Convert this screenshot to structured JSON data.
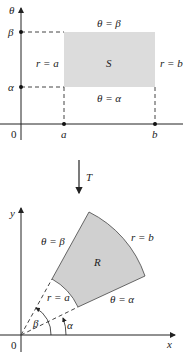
{
  "top_diagram": {
    "axis_vertical": "θ",
    "origin": "0",
    "tick_beta": "β",
    "tick_alpha": "α",
    "tick_a": "a",
    "tick_b": "b",
    "top_edge": "θ = β",
    "bottom_edge": "θ = α",
    "left_edge": "r = a",
    "right_edge": "r = b",
    "region": "S",
    "region_fill": "#dcdcdc"
  },
  "transform": {
    "label": "T"
  },
  "bottom_diagram": {
    "axis_x": "x",
    "axis_y": "y",
    "origin": "0",
    "beta_ray": "θ = β",
    "alpha_ray": "θ = α",
    "inner_arc": "r = a",
    "outer_arc": "r = b",
    "region": "R",
    "angle_beta": "β",
    "angle_alpha": "α",
    "region_fill": "#d0d0d0"
  }
}
